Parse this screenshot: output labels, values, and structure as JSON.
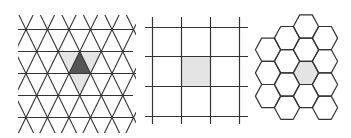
{
  "figure": {
    "panels": [
      {
        "id": "triangular",
        "name": "Triangular grid",
        "rows": 5,
        "vertices_per_row": 5,
        "highlighted_cell": {
          "row": 1,
          "col": 2,
          "orientation": "up",
          "color": "#555555"
        },
        "neighbor_cells": [
          {
            "row": 1,
            "col": 1,
            "orientation": "down"
          },
          {
            "row": 1,
            "col": 2,
            "orientation": "down"
          },
          {
            "row": 2,
            "col": 2,
            "orientation": "down"
          }
        ],
        "neighbor_color": "#e4e4e4"
      },
      {
        "id": "square",
        "name": "Square grid",
        "rows": 4,
        "cols": 4,
        "highlighted_cell": {
          "row": 1,
          "col": 1
        },
        "highlight_color": "#e4e4e4"
      },
      {
        "id": "hexagonal",
        "name": "Hexagonal grid",
        "columns": [
          {
            "count": 3,
            "start_offset": 1
          },
          {
            "count": 4,
            "start_offset": 0.5
          },
          {
            "count": 4,
            "start_offset": 0
          },
          {
            "count": 4,
            "start_offset": 0.5
          }
        ],
        "highlighted_cell": {
          "col": 2,
          "index": 2
        },
        "highlight_color": "#e4e4e4"
      }
    ],
    "colors": {
      "line": "#333333",
      "background": "#ffffff"
    }
  }
}
